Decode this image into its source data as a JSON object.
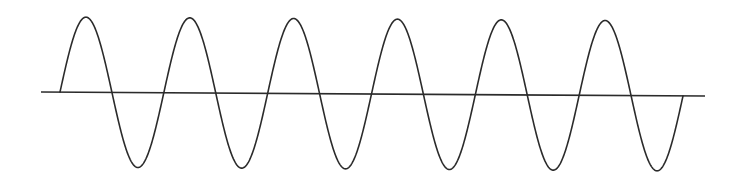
{
  "diagram": {
    "type": "sine-wave",
    "cycles": 6,
    "stroke_color": "#2b2b2b",
    "axis_color": "#2b2b2b",
    "background": "#ffffff",
    "axis": {
      "x1": 41,
      "y1": 92,
      "x2": 705,
      "y2": 96
    },
    "wave": {
      "x_start": 60,
      "x_end": 683,
      "baseline_start": 92,
      "baseline_end": 96,
      "amplitude": 75
    }
  }
}
